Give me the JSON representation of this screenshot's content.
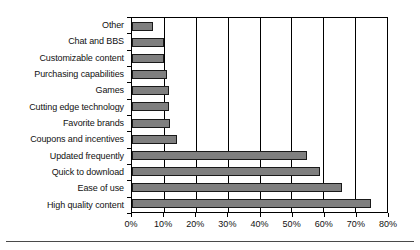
{
  "chart_data": {
    "type": "bar",
    "orientation": "horizontal",
    "title": "",
    "xlabel": "",
    "ylabel": "",
    "xlim": [
      0,
      80
    ],
    "xtick_labels": [
      "0%",
      "10%",
      "20%",
      "30%",
      "40%",
      "50%",
      "60%",
      "70%",
      "80%"
    ],
    "xticks": [
      0,
      10,
      20,
      30,
      40,
      50,
      60,
      70,
      80
    ],
    "grid": true,
    "legend": "none",
    "bar_color": "#7f7f7f",
    "bar_edge_color": "#1a1a1a",
    "categories": [
      "Other",
      "Chat and BBS",
      "Customizable content",
      "Purchasing capabilities",
      "Games",
      "Cutting edge technology",
      "Favorite brands",
      "Coupons and incentives",
      "Updated frequently",
      "Quick to download",
      "Ease of use",
      "High quality content"
    ],
    "values": [
      6.5,
      10,
      10,
      11,
      11.5,
      11.5,
      12,
      14,
      55,
      59,
      66,
      75
    ]
  }
}
